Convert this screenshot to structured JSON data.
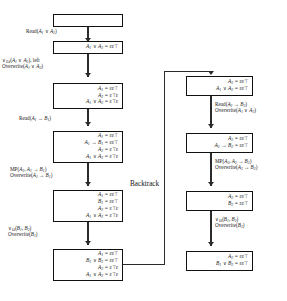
{
  "diagram": {
    "backtrack_label": "Backtrack",
    "left_column": {
      "boxes": [
        {
          "id": "L0",
          "lines": [
            ""
          ]
        },
        {
          "id": "L1",
          "lines": [
            "A₁ ∨ A₂ = εε⊤"
          ]
        },
        {
          "id": "L2",
          "lines": [
            "A₁ = εε⊤",
            "A₂ = ε⊤ε",
            "A₁ ∨ A₂ = ε⊤ε"
          ]
        },
        {
          "id": "L3",
          "lines": [
            "A₁ = εε⊤",
            "A₁ → B₁ = εε⊤",
            "A₂ = ε⊤ε",
            "A₁ ∨ A₂ = ε⊤ε"
          ]
        },
        {
          "id": "L4",
          "lines": [
            "A₁ = εε⊤",
            "B₁ = εε⊤",
            "A₂ = ε⊤ε",
            "A₁ ∨ A₂ = ε⊤ε"
          ]
        },
        {
          "id": "L5",
          "lines": [
            "A₁ = εε⊤",
            "B₁ ∨ B₂ = εε⊤",
            "A₂ = ε⊤ε",
            "A₁ ∨ A₂ = ε⊤ε"
          ]
        }
      ],
      "edges": [
        {
          "id": "E0",
          "lines": [
            "Read(A₁ ∨ A₂)"
          ]
        },
        {
          "id": "E1",
          "lines": [
            "∨Ed(A₁ ∨ A₂), left",
            "Overwrite(A₁ ∨ A₂)"
          ]
        },
        {
          "id": "E2",
          "lines": [
            "Read(A₁ → B₁)"
          ]
        },
        {
          "id": "E3",
          "lines": [
            "MP(A₁, A₁ → B₁)",
            "Overwrite(A₁ → B₁)"
          ]
        },
        {
          "id": "E4",
          "lines": [
            "∨Id(B₁, B₂)",
            "Overwrite(B₁)"
          ]
        }
      ]
    },
    "right_column": {
      "boxes": [
        {
          "id": "R1",
          "lines": [
            "A₂ = εε⊤",
            "A₁ ∨ A₂ = εε⊤"
          ]
        },
        {
          "id": "R2",
          "lines": [
            "A₂ = εε⊤",
            "A₂ → B₂ = εε⊤"
          ]
        },
        {
          "id": "R3",
          "lines": [
            "A₂ = εε⊤",
            "B₂ = εε⊤"
          ]
        },
        {
          "id": "R4",
          "lines": [
            "A₂ = εε⊤",
            "B₁ ∨ B₂ = εε⊤"
          ]
        }
      ],
      "edges": [
        {
          "id": "F1",
          "lines": [
            "Read(A₂ → B₂)",
            "Overwrite(A₁ ∨ A₂)"
          ]
        },
        {
          "id": "F2",
          "lines": [
            "MP(A₂, A₂ → B₂)",
            "Overwrite(A₂ → B₂)"
          ]
        },
        {
          "id": "F3",
          "lines": [
            "∨Id(B₁, B₂)",
            "Overwrite(B₂)"
          ]
        }
      ]
    }
  }
}
